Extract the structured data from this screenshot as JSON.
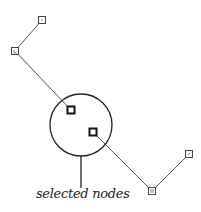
{
  "diagram": {
    "label": "selected nodes",
    "colors": {
      "edge": "#555555",
      "node": "#444444",
      "selected_node": "#111111",
      "circle": "#222222"
    },
    "nodes": [
      {
        "id": "n1",
        "x": 42,
        "y": 20,
        "selected": false
      },
      {
        "id": "n2",
        "x": 15,
        "y": 51,
        "selected": false
      },
      {
        "id": "n3",
        "x": 71,
        "y": 110,
        "selected": true
      },
      {
        "id": "n4",
        "x": 93,
        "y": 132,
        "selected": true
      },
      {
        "id": "n5",
        "x": 152,
        "y": 191,
        "selected": false
      },
      {
        "id": "n6",
        "x": 189,
        "y": 154,
        "selected": false
      }
    ],
    "edges": [
      [
        "n1",
        "n2"
      ],
      [
        "n2",
        "n3"
      ],
      [
        "n4",
        "n5"
      ],
      [
        "n5",
        "n6"
      ]
    ],
    "selection_circle": {
      "cx": 81,
      "cy": 125,
      "r": 31
    },
    "callout_line": {
      "x": 81,
      "y1": 156,
      "y2": 188
    }
  }
}
